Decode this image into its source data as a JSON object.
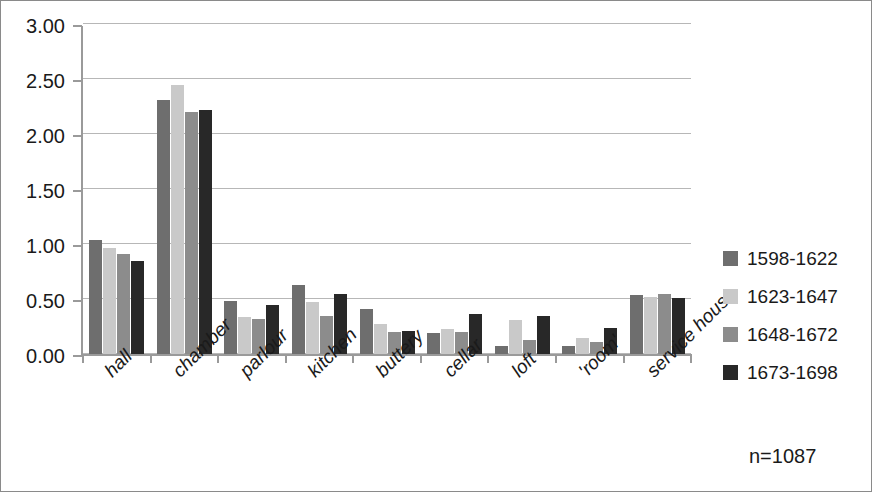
{
  "chart_data": {
    "type": "bar",
    "title": "",
    "xlabel": "",
    "ylabel": "",
    "ylim": [
      0,
      3
    ],
    "ytick_labels": [
      "0.00",
      "0.50",
      "1.00",
      "1.50",
      "2.00",
      "2.50",
      "3.00"
    ],
    "ytick_values": [
      0,
      0.5,
      1,
      1.5,
      2,
      2.5,
      3
    ],
    "grid": true,
    "legend_position": "right",
    "categories": [
      "hall",
      "chamber",
      "parlour",
      "kitchen",
      "buttery",
      "cellar",
      "loft",
      "'room'",
      "service house"
    ],
    "series": [
      {
        "name": "1598-1622",
        "color": "#6e6e6e",
        "values": [
          1.04,
          2.31,
          0.48,
          0.63,
          0.41,
          0.19,
          0.07,
          0.07,
          0.54
        ]
      },
      {
        "name": "1623-1647",
        "color": "#c9c9c9",
        "values": [
          0.96,
          2.45,
          0.34,
          0.47,
          0.27,
          0.23,
          0.31,
          0.15,
          0.52
        ]
      },
      {
        "name": "1648-1672",
        "color": "#8c8c8c",
        "values": [
          0.91,
          2.2,
          0.32,
          0.35,
          0.2,
          0.2,
          0.13,
          0.11,
          0.55
        ]
      },
      {
        "name": "1673-1698",
        "color": "#282828",
        "values": [
          0.85,
          2.22,
          0.45,
          0.55,
          0.21,
          0.36,
          0.35,
          0.24,
          0.51
        ]
      }
    ],
    "annotations": [
      {
        "text": "n=1087",
        "position": "bottom-right"
      }
    ]
  }
}
